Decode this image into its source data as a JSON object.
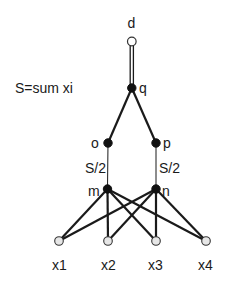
{
  "diagram": {
    "annotation": "S=sum xi",
    "nodes": {
      "d": {
        "label": "d",
        "style": "open"
      },
      "q": {
        "label": "q",
        "style": "filled"
      },
      "o": {
        "label": "o",
        "style": "filled"
      },
      "p": {
        "label": "p",
        "style": "filled"
      },
      "m": {
        "label": "m",
        "style": "filled"
      },
      "n": {
        "label": "n",
        "style": "filled"
      },
      "x1": {
        "label": "x1",
        "style": "leaf"
      },
      "x2": {
        "label": "x2",
        "style": "leaf"
      },
      "x3": {
        "label": "x3",
        "style": "leaf"
      },
      "x4": {
        "label": "x4",
        "style": "leaf"
      }
    },
    "edge_labels": {
      "o_m": "S/2",
      "p_n": "S/2"
    },
    "edges": [
      {
        "from": "d",
        "to": "q",
        "style": "double"
      },
      {
        "from": "q",
        "to": "o",
        "style": "thick"
      },
      {
        "from": "q",
        "to": "p",
        "style": "thick"
      },
      {
        "from": "o",
        "to": "m",
        "style": "thin"
      },
      {
        "from": "p",
        "to": "n",
        "style": "thin"
      },
      {
        "from": "m",
        "to": "x1",
        "style": "thick"
      },
      {
        "from": "m",
        "to": "x2",
        "style": "thick"
      },
      {
        "from": "m",
        "to": "x3",
        "style": "thick"
      },
      {
        "from": "m",
        "to": "x4",
        "style": "thick"
      },
      {
        "from": "n",
        "to": "x1",
        "style": "thick"
      },
      {
        "from": "n",
        "to": "x2",
        "style": "thick"
      },
      {
        "from": "n",
        "to": "x3",
        "style": "thick"
      },
      {
        "from": "n",
        "to": "x4",
        "style": "thick"
      }
    ]
  }
}
